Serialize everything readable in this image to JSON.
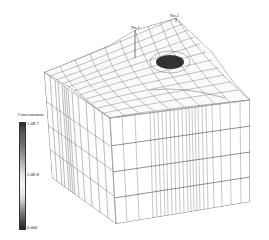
{
  "figure": {
    "type": "3D finite-element mesh block with concentration shading",
    "wells": [
      {
        "label": "No.1"
      },
      {
        "label": "No.2"
      }
    ],
    "legend": {
      "title": "Concentration",
      "max_label": "1.0E-7",
      "mid_label": "5.0E-8",
      "min_label": "0.000"
    },
    "colors": {
      "mesh": "#333333",
      "plume": "#111111",
      "background": "#ffffff"
    }
  }
}
